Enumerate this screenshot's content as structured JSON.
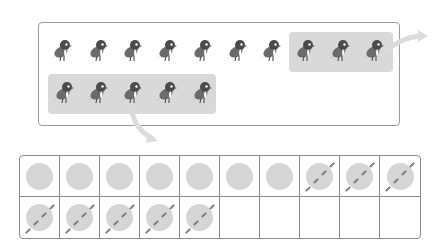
{
  "diagram": {
    "birds": {
      "total": 15,
      "row1_count": 10,
      "row2_count": 5,
      "highlighted_row1_indices": [
        7,
        8,
        9
      ],
      "highlighted_row2_indices": [
        0,
        1,
        2,
        3,
        4
      ],
      "highlighted_total": 8
    },
    "grid": {
      "columns": 10,
      "rows": 2,
      "cells": [
        [
          "dot",
          "dot",
          "dot",
          "dot",
          "dot",
          "dot",
          "dot",
          "crossed",
          "crossed",
          "crossed"
        ],
        [
          "crossed",
          "crossed",
          "crossed",
          "crossed",
          "crossed",
          "empty",
          "empty",
          "empty",
          "empty",
          "empty"
        ]
      ],
      "plain_dots": 7,
      "crossed_dots": 8
    },
    "colors": {
      "highlight": "#d9d9d9",
      "dot": "#d6d6d6",
      "border": "#8a8a8a",
      "bird_body": "#6b6b6b",
      "arrow": "#dcdcdc"
    },
    "icons": {
      "bird": "bird-icon",
      "arrow": "curved-arrow-icon",
      "counter": "circle-counter-icon"
    }
  }
}
